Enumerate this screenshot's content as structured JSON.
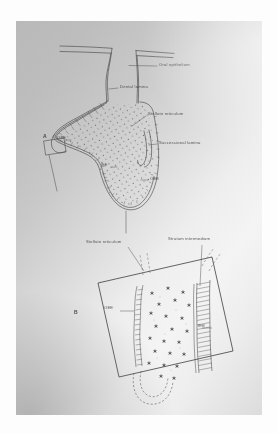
{
  "page": {
    "kind": "scanned-textbook-figure",
    "background_color": "#ffffff",
    "sheet_color": "#d8d8d8",
    "ink_color": "#3c3c3c"
  },
  "figures": [
    {
      "panel_label": "A",
      "caption_hint": "Cap/bell stage tooth germ in sagittal section",
      "labels": [
        {
          "id": "oral-epithelium",
          "text": "Oral epithelium",
          "x": 143,
          "y": 44,
          "leader_to": [
            112,
            47
          ]
        },
        {
          "id": "dental-lamina",
          "text": "Dental lamina",
          "x": 104,
          "y": 66,
          "leader_to": [
            92,
            69
          ]
        },
        {
          "id": "stellate-reticulum",
          "text": "Stellate reticulum",
          "x": 132,
          "y": 93,
          "leader_to": [
            114,
            106
          ]
        },
        {
          "id": "successional-lamina",
          "text": "Successional lamina",
          "x": 143,
          "y": 122,
          "leader_to": [
            131,
            124
          ]
        },
        {
          "id": "panel-a",
          "text": "A",
          "x": 29,
          "y": 116
        },
        {
          "id": "oee-upper",
          "text": "OEE",
          "x": 42,
          "y": 118
        },
        {
          "id": "iee",
          "text": "IEE",
          "x": 85,
          "y": 145
        },
        {
          "id": "oee-lower",
          "text": "OEE",
          "x": 134,
          "y": 158
        }
      ]
    },
    {
      "panel_label": "B",
      "caption_hint": "Magnified enamel organ layers within rotated field box",
      "labels": [
        {
          "id": "stellate-reticulum-b",
          "text": "Stellate reticulum",
          "x": 88,
          "y": 222,
          "leader_to": [
            128,
            246
          ]
        },
        {
          "id": "stratum-intermedium",
          "text": "Stratum intermedium",
          "x": 170,
          "y": 219,
          "leader_to": [
            181,
            265
          ]
        },
        {
          "id": "panel-b",
          "text": "B",
          "x": 76,
          "y": 292
        },
        {
          "id": "oee-b",
          "text": "OEE",
          "x": 109,
          "y": 287,
          "leader_to": [
            133,
            288
          ]
        },
        {
          "id": "iee-b",
          "text": "IEE",
          "x": 198,
          "y": 305,
          "leader_to": [
            186,
            305
          ]
        }
      ]
    }
  ]
}
